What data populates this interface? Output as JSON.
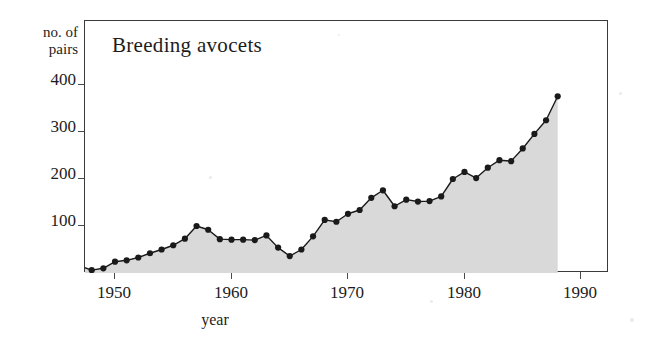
{
  "chart_data": {
    "type": "line",
    "title": "Breeding avocets",
    "xlabel": "year",
    "ylabel": "no. of pairs",
    "xlim": [
      1946,
      1990
    ],
    "ylim": [
      0,
      440
    ],
    "grid": false,
    "legend": null,
    "filled": true,
    "fill_color": "#d9d9d9",
    "line_color": "#1a1a1a",
    "marker": "filled-circle",
    "xticks": [
      1950,
      1960,
      1970,
      1980,
      1990
    ],
    "yticks": [
      100,
      200,
      300,
      400
    ],
    "x": [
      1947,
      1948,
      1949,
      1950,
      1951,
      1952,
      1953,
      1954,
      1955,
      1956,
      1957,
      1958,
      1959,
      1960,
      1961,
      1962,
      1963,
      1964,
      1965,
      1966,
      1967,
      1968,
      1969,
      1970,
      1971,
      1972,
      1973,
      1974,
      1975,
      1976,
      1977,
      1978,
      1979,
      1980,
      1981,
      1982,
      1983,
      1984,
      1985,
      1986,
      1987,
      1988
    ],
    "values": [
      15,
      6,
      10,
      24,
      27,
      33,
      42,
      50,
      59,
      73,
      100,
      92,
      72,
      71,
      71,
      70,
      80,
      54,
      36,
      50,
      78,
      113,
      109,
      126,
      134,
      160,
      176,
      142,
      156,
      152,
      153,
      163,
      200,
      215,
      202,
      224,
      240,
      238,
      265,
      296,
      325,
      376
    ]
  },
  "axis": {
    "y_label_line1": "no. of",
    "y_label_line2": "pairs",
    "y_ticks": [
      "400",
      "300",
      "200",
      "100"
    ],
    "x_ticks": [
      "1950",
      "1960",
      "1970",
      "1980",
      "1990"
    ],
    "x_axis_title": "year"
  }
}
